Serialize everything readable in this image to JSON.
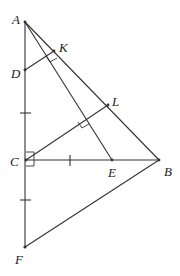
{
  "diagram": {
    "type": "geometry",
    "points": {
      "A": {
        "label": "A",
        "x": 25,
        "y": 22
      },
      "K": {
        "label": "K",
        "x": 54,
        "y": 51
      },
      "D": {
        "label": "D",
        "x": 25,
        "y": 70
      },
      "L": {
        "label": "L",
        "x": 108,
        "y": 105
      },
      "C": {
        "label": "C",
        "x": 26,
        "y": 160
      },
      "E": {
        "label": "E",
        "x": 112,
        "y": 160
      },
      "B": {
        "label": "B",
        "x": 159,
        "y": 160
      },
      "F": {
        "label": "F",
        "x": 25,
        "y": 247
      }
    },
    "segments": [
      "AF",
      "AB",
      "AE",
      "CB",
      "CL",
      "DK",
      "FB"
    ],
    "right_angles": [
      "C (ACB)",
      "K (DK ⊥ AB)",
      "intersection of AE and CL"
    ],
    "tick_marks": [
      "AC segment upper",
      "CF segment",
      "CE segment"
    ]
  }
}
